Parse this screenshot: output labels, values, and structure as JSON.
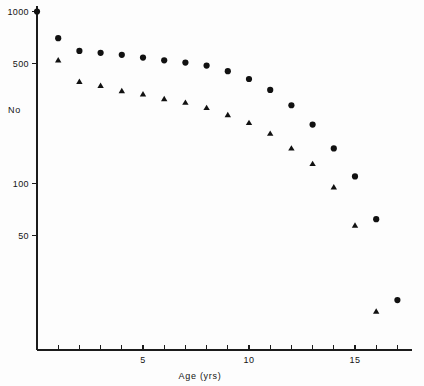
{
  "chart_data": {
    "type": "scatter",
    "title": "",
    "subtitle": "",
    "xlabel": "Age (yrs)",
    "ylabel": "No",
    "yscale": "log",
    "ylim": [
      15,
      1000
    ],
    "xlim": [
      0,
      17.8
    ],
    "grid": false,
    "legend": "none",
    "y_ticks": [
      {
        "label": "1000",
        "value": 1000
      },
      {
        "label": "500",
        "value": 500
      },
      {
        "label": "100",
        "value": 100
      },
      {
        "label": "50",
        "value": 50
      }
    ],
    "x_ticks_labelled": [
      {
        "label": "5",
        "value": 5
      },
      {
        "label": "10",
        "value": 10
      },
      {
        "label": "15",
        "value": 15
      }
    ],
    "x_ticks_all": [
      1,
      2,
      3,
      4,
      5,
      6,
      7,
      8,
      9,
      10,
      11,
      12,
      13,
      14,
      15,
      16,
      17
    ],
    "series": [
      {
        "name": "circles",
        "marker": "circle",
        "color": "#111111",
        "x": [
          0,
          1,
          2,
          3,
          4,
          5,
          6,
          7,
          8,
          9,
          10,
          11,
          12,
          13,
          14,
          15,
          16,
          17
        ],
        "values": [
          1000,
          700,
          590,
          575,
          560,
          540,
          520,
          505,
          485,
          450,
          405,
          350,
          285,
          220,
          160,
          110,
          62,
          21
        ]
      },
      {
        "name": "triangles",
        "marker": "triangle",
        "color": "#111111",
        "x": [
          1,
          2,
          3,
          4,
          5,
          6,
          7,
          8,
          9,
          10,
          11,
          12,
          13,
          14,
          15,
          16
        ],
        "values": [
          520,
          390,
          370,
          345,
          330,
          310,
          295,
          275,
          250,
          225,
          195,
          160,
          130,
          95,
          57,
          18
        ]
      }
    ]
  },
  "labels": {
    "y_axis_title": "No",
    "x_axis_title": "Age (yrs)"
  }
}
